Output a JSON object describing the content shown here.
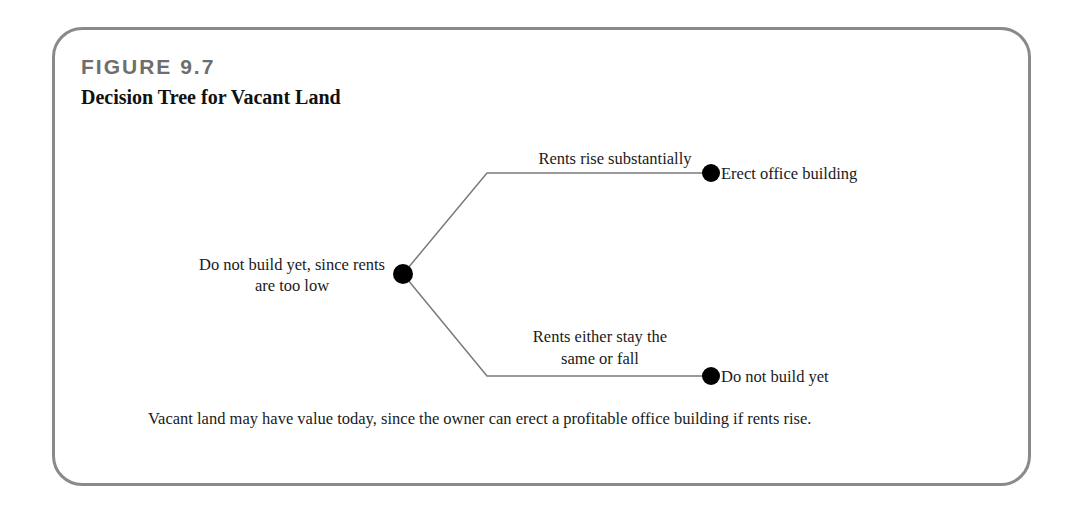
{
  "figure": {
    "number": "FIGURE 9.7",
    "title": "Decision Tree for Vacant Land",
    "caption": "Vacant land may have value today, since the owner can erect a profitable office building if rents rise."
  },
  "tree": {
    "root": {
      "label": "Do not build yet, since rents are too low"
    },
    "branches": [
      {
        "condition": "Rents rise substantially",
        "outcome": "Erect office building"
      },
      {
        "condition": "Rents either stay the same or fall",
        "outcome": "Do not build yet"
      }
    ]
  },
  "colors": {
    "frame": "#8a8a8a",
    "figure_number": "#6e6e6e",
    "lines": "#7a7a7a",
    "nodes": "#000000"
  }
}
